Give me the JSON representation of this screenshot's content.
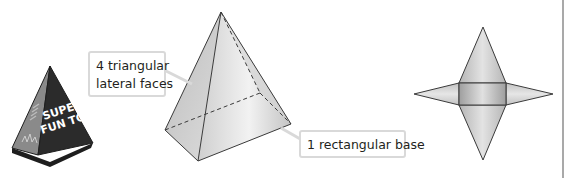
{
  "figure": {
    "toy": {
      "label_line1": "SUPER",
      "label_line2": "FUN TOY"
    },
    "callouts": {
      "lateral_faces_line1": "4 triangular",
      "lateral_faces_line2": "lateral faces",
      "base": "1 rectangular base"
    },
    "colors": {
      "face_light": "#e6e6e6",
      "face_mid": "#c8c8c8",
      "face_dark": "#a9a9a9",
      "outline": "#3a3a3a",
      "callout_border": "#d9d9d9",
      "toy_body": "#2b2b2b",
      "toy_side": "#7a7a7a",
      "divider": "#8c8c8c"
    }
  }
}
